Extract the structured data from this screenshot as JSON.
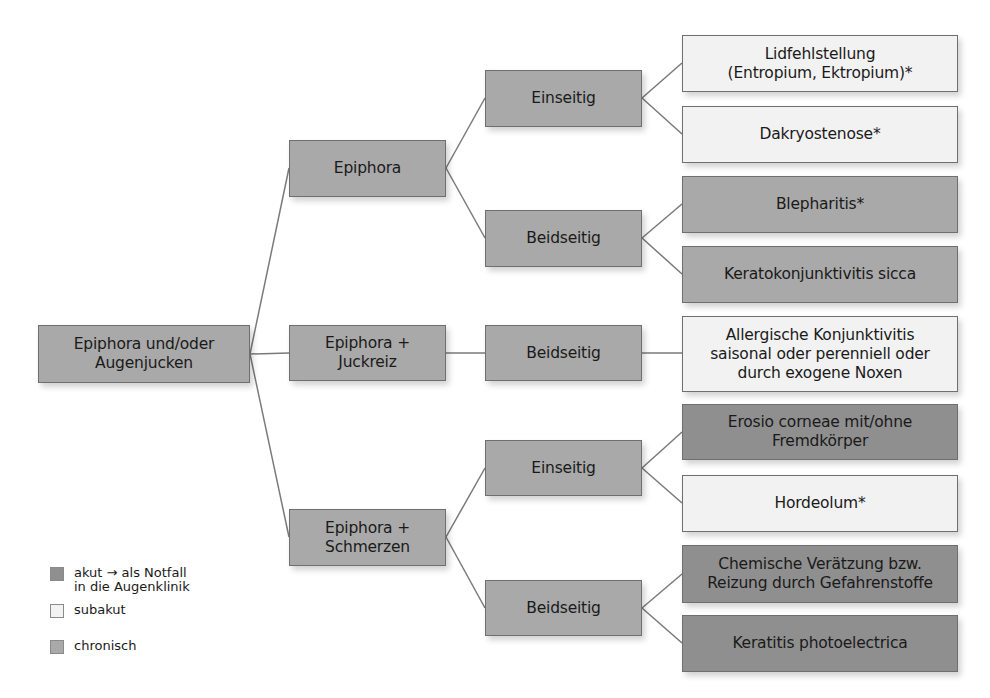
{
  "colors": {
    "acute": "#8f8f8f",
    "subacute": "#f2f2f2",
    "chronic": "#a9a9a9",
    "connector": "#7a7a7a"
  },
  "root": {
    "label": "Epiphora und/oder\nAugenjucken"
  },
  "level1": [
    {
      "label": "Epiphora"
    },
    {
      "label": "Epiphora +\nJuckreiz"
    },
    {
      "label": "Epiphora +\nSchmerzen"
    }
  ],
  "level2": [
    {
      "label": "Einseitig",
      "parent": "Epiphora"
    },
    {
      "label": "Beidseitig",
      "parent": "Epiphora"
    },
    {
      "label": "Beidseitig",
      "parent": "Epiphora + Juckreiz"
    },
    {
      "label": "Einseitig",
      "parent": "Epiphora + Schmerzen"
    },
    {
      "label": "Beidseitig",
      "parent": "Epiphora + Schmerzen"
    }
  ],
  "diagnoses": [
    {
      "label": "Lidfehlstellung\n(Entropium, Ektropium)*",
      "category": "subakut"
    },
    {
      "label": "Dakryostenose*",
      "category": "subakut"
    },
    {
      "label": "Blepharitis*",
      "category": "chronisch"
    },
    {
      "label": "Keratokonjunktivitis sicca",
      "category": "chronisch"
    },
    {
      "label": "Allergische Konjunktivitis\nsaisonal oder perenniell oder\ndurch exogene Noxen",
      "category": "subakut"
    },
    {
      "label": "Erosio corneae mit/ohne\nFremdkörper",
      "category": "akut"
    },
    {
      "label": "Hordeolum*",
      "category": "subakut"
    },
    {
      "label": "Chemische Verätzung bzw.\nReizung durch Gefahrenstoffe",
      "category": "akut"
    },
    {
      "label": "Keratitis photoelectrica",
      "category": "akut"
    }
  ],
  "legend": [
    {
      "label": "akut → als Notfall\nin die Augenklinik",
      "category": "akut"
    },
    {
      "label": "subakut",
      "category": "subakut"
    },
    {
      "label": "chronisch",
      "category": "chronisch"
    }
  ]
}
